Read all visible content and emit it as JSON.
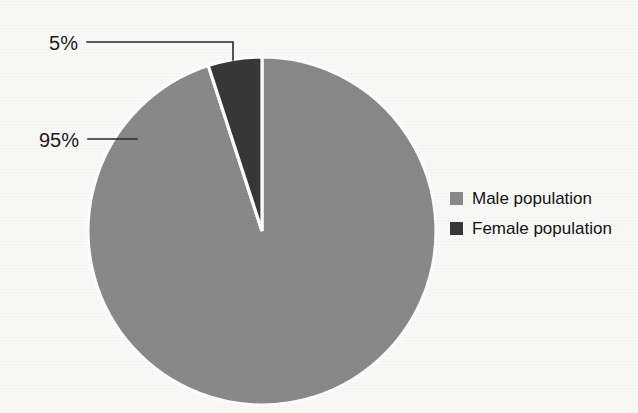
{
  "chart_data": {
    "type": "pie",
    "title": "",
    "categories": [
      "Male population",
      "Female population"
    ],
    "values": [
      95,
      5
    ],
    "labels": [
      "95%",
      "5%"
    ],
    "colors": [
      "#8a8a8a",
      "#383838"
    ],
    "legend_position": "right",
    "grid": false,
    "slice_separator_color": "#ffffff",
    "slices": [
      {
        "name": "Male population",
        "value": 95,
        "label": "95%",
        "color": "#8a8a8a"
      },
      {
        "name": "Female population",
        "value": 5,
        "label": "5%",
        "color": "#383838"
      }
    ]
  },
  "labels": {
    "female_pct": "5%",
    "male_pct": "95%"
  },
  "legend": {
    "items": [
      {
        "label": "Male population",
        "color": "#8a8a8a"
      },
      {
        "label": "Female population",
        "color": "#383838"
      }
    ]
  },
  "colors": {
    "background": "#fbfbfa",
    "male": "#8a8a8a",
    "female": "#383838",
    "text": "#1c1c1c",
    "leader_line": "#2a2a2a"
  }
}
